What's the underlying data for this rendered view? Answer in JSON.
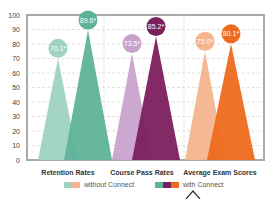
{
  "chart_data": {
    "type": "bar",
    "title": "",
    "xlabel": "",
    "ylabel": "",
    "ylim": [
      0,
      100
    ],
    "yticks": [
      0,
      10,
      20,
      30,
      40,
      50,
      60,
      70,
      80,
      90,
      100
    ],
    "grid": true,
    "categories": [
      "Retention Rates",
      "Course Pass Rates",
      "Average Exam Scores"
    ],
    "series": [
      {
        "name": "without Connect",
        "values": [
          70.1,
          73.5,
          75.0
        ],
        "labels": [
          "70.1*",
          "73.5*",
          "75.0*"
        ],
        "colors": [
          "#9fd3c0",
          "#c9a2cc",
          "#f3b48e"
        ]
      },
      {
        "name": "with Connect",
        "values": [
          89.6,
          85.2,
          80.1
        ],
        "labels": [
          "89.6*",
          "85.2*",
          "80.1*"
        ],
        "colors": [
          "#5fb39a",
          "#7c1f5e",
          "#ee6a1e"
        ]
      }
    ],
    "legend_position": "bottom"
  },
  "legend": {
    "without": "without Connect",
    "with": "with Connect"
  }
}
